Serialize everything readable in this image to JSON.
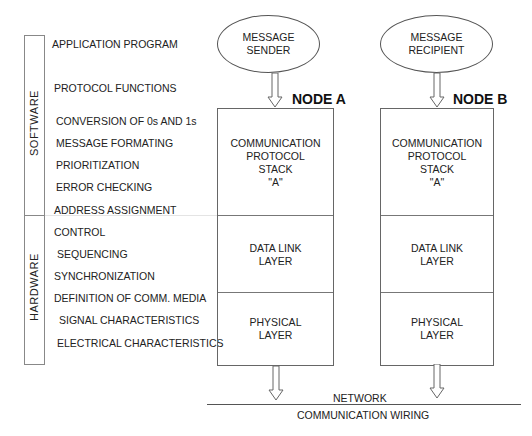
{
  "left_panel": {
    "software_label": "SOFTWARE",
    "hardware_label": "HARDWARE",
    "functions": [
      {
        "label": "APPLICATION PROGRAM",
        "x": 52,
        "y": 38
      },
      {
        "label": "PROTOCOL FUNCTIONS",
        "x": 54,
        "y": 82
      },
      {
        "label": "CONVERSION OF 0s AND 1s",
        "x": 56,
        "y": 115
      },
      {
        "label": "MESSAGE FORMATING",
        "x": 56,
        "y": 137
      },
      {
        "label": "PRIORITIZATION",
        "x": 56,
        "y": 159
      },
      {
        "label": "ERROR CHECKING",
        "x": 56,
        "y": 181
      },
      {
        "label": "ADDRESS ASSIGNMENT",
        "x": 54,
        "y": 204
      },
      {
        "label": "CONTROL",
        "x": 54,
        "y": 226
      },
      {
        "label": "SEQUENCING",
        "x": 57,
        "y": 248
      },
      {
        "label": "SYNCHRONIZATION",
        "x": 54,
        "y": 270
      },
      {
        "label": "DEFINITION OF COMM. MEDIA",
        "x": 54,
        "y": 292
      },
      {
        "label": "SIGNAL CHARACTERISTICS",
        "x": 59,
        "y": 314
      },
      {
        "label": "ELECTRICAL CHARACTERISTICS",
        "x": 57,
        "y": 337
      }
    ]
  },
  "nodes": [
    {
      "name": "NODE A",
      "endpoint": [
        "MESSAGE",
        "SENDER"
      ],
      "layers": {
        "stack": [
          "COMMUNICATION",
          "PROTOCOL",
          "STACK",
          "\"A\""
        ],
        "datalink": [
          "DATA LINK",
          "LAYER"
        ],
        "physical": [
          "PHYSICAL",
          "LAYER"
        ]
      }
    },
    {
      "name": "NODE B",
      "endpoint": [
        "MESSAGE",
        "RECIPIENT"
      ],
      "layers": {
        "stack": [
          "COMMUNICATION",
          "PROTOCOL",
          "STACK",
          "\"A\""
        ],
        "datalink": [
          "DATA LINK",
          "LAYER"
        ],
        "physical": [
          "PHYSICAL",
          "LAYER"
        ]
      }
    }
  ],
  "network": {
    "top_label": "NETWORK",
    "bottom_label": "COMMUNICATION WIRING"
  },
  "colors": {
    "line": "#666666",
    "text": "#222222"
  }
}
